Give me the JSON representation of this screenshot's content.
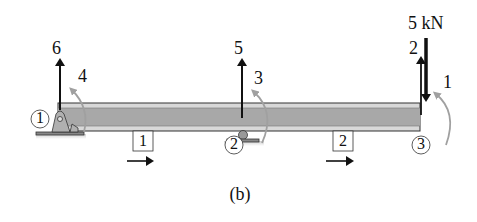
{
  "caption": "(b)",
  "nodes": [
    {
      "id": "1",
      "label": "1",
      "support": "pin"
    },
    {
      "id": "2",
      "label": "2",
      "support": "roller"
    },
    {
      "id": "3",
      "label": "3",
      "support": "free"
    }
  ],
  "elements": [
    {
      "id": "1",
      "label": "1",
      "from": "1",
      "to": "2"
    },
    {
      "id": "2",
      "label": "2",
      "from": "2",
      "to": "3"
    }
  ],
  "dofs": [
    {
      "number": "6",
      "node": "1",
      "type": "vertical"
    },
    {
      "number": "4",
      "node": "1",
      "type": "rotation"
    },
    {
      "number": "5",
      "node": "2",
      "type": "vertical"
    },
    {
      "number": "3",
      "node": "2",
      "type": "rotation"
    },
    {
      "number": "2",
      "node": "3",
      "type": "vertical"
    },
    {
      "number": "1",
      "node": "3",
      "type": "rotation"
    }
  ],
  "load": {
    "label": "5 kN",
    "node": "3",
    "direction": "down"
  },
  "colors": {
    "beam_fill": "#a8a8a8",
    "beam_flange": "#d8d8d8",
    "support": "#b0b0b0",
    "rotation_arrow": "#a0a0a0",
    "ink": "#111111"
  }
}
